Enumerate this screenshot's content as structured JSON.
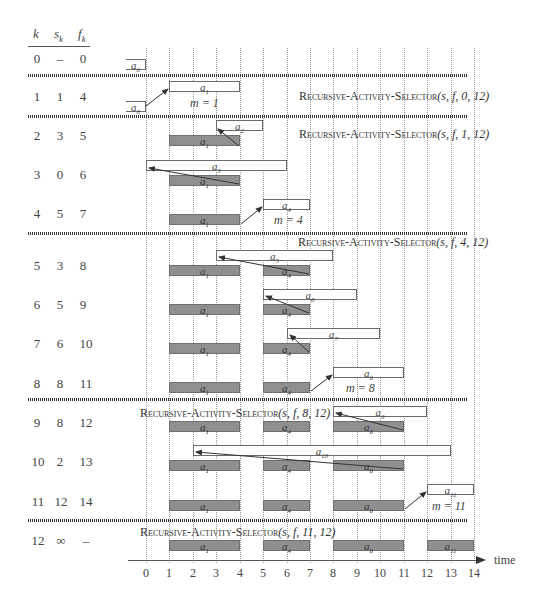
{
  "table": {
    "headers": {
      "k": "k",
      "s": "s",
      "s_sub": "k",
      "f": "f",
      "f_sub": "k"
    },
    "rows": [
      {
        "k": "0",
        "s": "–",
        "f": "0"
      },
      {
        "k": "1",
        "s": "1",
        "f": "4"
      },
      {
        "k": "2",
        "s": "3",
        "f": "5"
      },
      {
        "k": "3",
        "s": "0",
        "f": "6"
      },
      {
        "k": "4",
        "s": "5",
        "f": "7"
      },
      {
        "k": "5",
        "s": "3",
        "f": "8"
      },
      {
        "k": "6",
        "s": "5",
        "f": "9"
      },
      {
        "k": "7",
        "s": "6",
        "f": "10"
      },
      {
        "k": "8",
        "s": "8",
        "f": "11"
      },
      {
        "k": "9",
        "s": "8",
        "f": "12"
      },
      {
        "k": "10",
        "s": "2",
        "f": "13"
      },
      {
        "k": "11",
        "s": "12",
        "f": "14"
      },
      {
        "k": "12",
        "s": "∞",
        "f": "–"
      }
    ]
  },
  "calls": [
    {
      "name": "Recursive-Activity-Selector",
      "args": "(s, f, 0, 12)"
    },
    {
      "name": "Recursive-Activity-Selector",
      "args": "(s, f, 1, 12)"
    },
    {
      "name": "Recursive-Activity-Selector",
      "args": "(s, f, 4, 12)"
    },
    {
      "name": "Recursive-Activity-Selector",
      "args": "(s, f, 8, 12)"
    },
    {
      "name": "Recursive-Activity-Selector",
      "args": "(s, f, 11, 12)"
    }
  ],
  "m_labels": [
    "m = 1",
    "m = 4",
    "m = 8",
    "m = 11"
  ],
  "activity_labels": {
    "a0": "a",
    "a0_sub": "0",
    "a1": "a",
    "a1_sub": "1",
    "a2": "a",
    "a2_sub": "2",
    "a3": "a",
    "a3_sub": "3",
    "a4": "a",
    "a4_sub": "4",
    "a5": "a",
    "a5_sub": "5",
    "a6": "a",
    "a6_sub": "6",
    "a7": "a",
    "a7_sub": "7",
    "a8": "a",
    "a8_sub": "8",
    "a9": "a",
    "a9_sub": "9",
    "a10": "a",
    "a10_sub": "10",
    "a11": "a",
    "a11_sub": "11"
  },
  "axis": {
    "label": "time",
    "ticks": [
      "0",
      "1",
      "2",
      "3",
      "4",
      "5",
      "6",
      "7",
      "8",
      "9",
      "10",
      "11",
      "12",
      "13",
      "14"
    ]
  },
  "colors": {
    "selected_fill": "#8f8f8f",
    "open_fill": "#ffffff",
    "border": "#6a6a6a",
    "arrow": "#333333",
    "grid": "#9a9a9a"
  }
}
